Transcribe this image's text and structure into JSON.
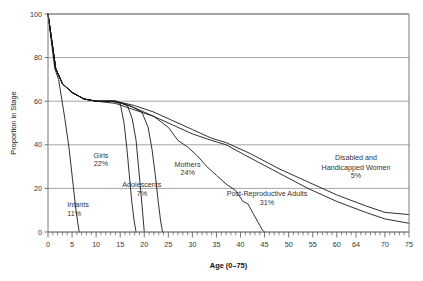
{
  "chart_data": {
    "type": "line",
    "title": "",
    "xlabel": "Age (0–75)",
    "ylabel": "Proportion in Stage",
    "xlim": [
      0,
      75
    ],
    "ylim": [
      0,
      100
    ],
    "grid": true,
    "grid_axis": "y",
    "legend_position": "inline-annotations",
    "x_ticks_major": [
      0,
      5,
      10,
      15,
      20,
      25,
      30,
      35,
      40,
      45,
      50,
      55,
      60,
      64,
      70,
      75
    ],
    "x_tick_labels": [
      "0",
      "5",
      "10",
      "15",
      "20",
      "25",
      "30",
      "35",
      "40",
      "45",
      "50",
      "55",
      "60",
      "64",
      "70",
      "75"
    ],
    "x_tick_minor_interval": 1,
    "y_ticks": [
      0,
      20,
      40,
      60,
      80,
      100
    ],
    "y_tick_labels": [
      "0",
      "20",
      "40",
      "60",
      "80",
      "100"
    ],
    "series": [
      {
        "name": "Infants",
        "share_label": "11%",
        "points": [
          [
            0,
            100
          ],
          [
            1.4,
            75
          ],
          [
            2.2,
            70
          ],
          [
            3.5,
            52
          ],
          [
            4.4,
            38
          ],
          [
            5.1,
            24
          ],
          [
            5.7,
            12
          ],
          [
            6.2,
            4
          ],
          [
            6.5,
            0
          ]
        ]
      },
      {
        "name": "Girls",
        "share_label": "22%",
        "points": [
          [
            0,
            100
          ],
          [
            1.6,
            75
          ],
          [
            3.0,
            68
          ],
          [
            5.0,
            64
          ],
          [
            7.5,
            61
          ],
          [
            10.0,
            60
          ],
          [
            13.0,
            60
          ],
          [
            15.0,
            59
          ],
          [
            15.8,
            50
          ],
          [
            16.4,
            38
          ],
          [
            16.9,
            26
          ],
          [
            17.4,
            14
          ],
          [
            17.9,
            5
          ],
          [
            18.3,
            0
          ]
        ]
      },
      {
        "name": "Adolescents",
        "share_label": "7%",
        "points": [
          [
            0,
            100
          ],
          [
            1.6,
            75
          ],
          [
            3.0,
            68
          ],
          [
            5.0,
            64
          ],
          [
            7.5,
            61
          ],
          [
            10.0,
            60
          ],
          [
            14.0,
            60
          ],
          [
            16.5,
            58
          ],
          [
            17.5,
            52
          ],
          [
            18.3,
            42
          ],
          [
            18.8,
            30
          ],
          [
            19.3,
            18
          ],
          [
            19.7,
            8
          ],
          [
            20.0,
            0
          ]
        ]
      },
      {
        "name": "Mothers",
        "share_label": "24%",
        "points": [
          [
            0,
            100
          ],
          [
            1.6,
            75
          ],
          [
            3.0,
            68
          ],
          [
            5.0,
            64
          ],
          [
            7.5,
            61
          ],
          [
            10.0,
            60
          ],
          [
            14.0,
            60
          ],
          [
            17.0,
            58
          ],
          [
            19.5,
            55
          ],
          [
            20.8,
            48
          ],
          [
            21.6,
            38
          ],
          [
            22.3,
            26
          ],
          [
            22.9,
            14
          ],
          [
            23.4,
            5
          ],
          [
            23.8,
            0
          ]
        ]
      },
      {
        "name": "Post-Reproductive Adults",
        "share_label": "31%",
        "points": [
          [
            0,
            100
          ],
          [
            1.6,
            75
          ],
          [
            3.0,
            68
          ],
          [
            5.0,
            64
          ],
          [
            7.5,
            61
          ],
          [
            10.0,
            60
          ],
          [
            14.0,
            60
          ],
          [
            18.0,
            57
          ],
          [
            22.0,
            53
          ],
          [
            25.0,
            48
          ],
          [
            27.0,
            42
          ],
          [
            29.0,
            39
          ],
          [
            31.0,
            35
          ],
          [
            33.0,
            30
          ],
          [
            35.0,
            26
          ],
          [
            37.0,
            22
          ],
          [
            39.0,
            19
          ],
          [
            40.5,
            14
          ],
          [
            41.5,
            13
          ],
          [
            42.5,
            9
          ],
          [
            43.5,
            5
          ],
          [
            44.5,
            1
          ],
          [
            45.0,
            0
          ]
        ]
      },
      {
        "name": "Disabled and Handicapped Women (upper)",
        "share_label": "5%",
        "points": [
          [
            0,
            100
          ],
          [
            1.6,
            75
          ],
          [
            3.0,
            68
          ],
          [
            5.0,
            64
          ],
          [
            7.5,
            61
          ],
          [
            10.0,
            60
          ],
          [
            14.0,
            60
          ],
          [
            18.0,
            58
          ],
          [
            22.0,
            55
          ],
          [
            26.0,
            51
          ],
          [
            30.0,
            47
          ],
          [
            34.0,
            43
          ],
          [
            37.0,
            41
          ],
          [
            42.0,
            36
          ],
          [
            48.0,
            29
          ],
          [
            54.0,
            23
          ],
          [
            60.0,
            17
          ],
          [
            66.0,
            12
          ],
          [
            70.0,
            9
          ],
          [
            75.0,
            8
          ]
        ]
      },
      {
        "name": "Disabled and Handicapped Women (lower)",
        "share_label": "5%",
        "points": [
          [
            0,
            100
          ],
          [
            1.6,
            75
          ],
          [
            3.0,
            68
          ],
          [
            5.0,
            64
          ],
          [
            7.5,
            61
          ],
          [
            10.0,
            60
          ],
          [
            14.0,
            59
          ],
          [
            18.0,
            56
          ],
          [
            22.0,
            53
          ],
          [
            26.0,
            49
          ],
          [
            30.0,
            45
          ],
          [
            34.0,
            42
          ],
          [
            37.0,
            40
          ],
          [
            42.0,
            34
          ],
          [
            48.0,
            27
          ],
          [
            54.0,
            20
          ],
          [
            60.0,
            14
          ],
          [
            66.0,
            9
          ],
          [
            70.0,
            6
          ],
          [
            75.0,
            4
          ]
        ]
      }
    ],
    "annotations": [
      {
        "text": "Infants",
        "value": "11%",
        "x_data": 4.0,
        "y_data": 11.5,
        "align": "start"
      },
      {
        "text": "Girls",
        "value": "22%",
        "x_data": 11.0,
        "y_data": 34.0,
        "align": "middle"
      },
      {
        "text": "Adolescents",
        "value": "7%",
        "x_data": 19.5,
        "y_data": 20.5,
        "align": "middle"
      },
      {
        "text": "Mothers",
        "value": "24%",
        "x_data": 29.0,
        "y_data": 30.0,
        "align": "middle"
      },
      {
        "text": "Post-Reproductive Adults",
        "value": "31%",
        "x_data": 45.5,
        "y_data": 16.5,
        "align": "middle"
      },
      {
        "text": "Disabled and",
        "value": "",
        "x_data": 64.0,
        "y_data": 33.0,
        "align": "middle"
      },
      {
        "text": "Handicapped Women",
        "value": "5%",
        "x_data": 64.0,
        "y_data": 28.5,
        "align": "middle"
      }
    ]
  }
}
